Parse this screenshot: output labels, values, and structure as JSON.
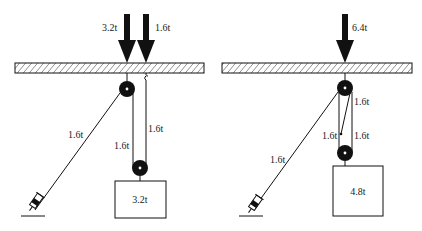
{
  "diagrams": [
    {
      "id": "left",
      "load_arrows": [
        {
          "label": "3.2t"
        },
        {
          "label": "1.6t"
        }
      ],
      "rope_labels": {
        "inclined": "1.6t",
        "left_vertical": "1.6t",
        "right_vertical": "1.6t"
      },
      "weight_label": "3.2t"
    },
    {
      "id": "right",
      "load_arrows": [
        {
          "label": "6.4t"
        }
      ],
      "rope_labels": {
        "inclined": "1.6t",
        "upper_right": "1.6t",
        "lower_left": "1.6t",
        "lower_right": "1.6t"
      },
      "weight_label": "4.8t"
    }
  ],
  "colors": {
    "stroke": "#111111",
    "background": "#ffffff"
  }
}
